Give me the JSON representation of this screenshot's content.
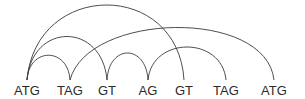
{
  "diagram": {
    "type": "arc-diagram",
    "nodes": [
      {
        "id": "n0",
        "label": "ATG",
        "x": 27
      },
      {
        "id": "n1",
        "label": "TAG",
        "x": 70
      },
      {
        "id": "n2",
        "label": "GT",
        "x": 107
      },
      {
        "id": "n3",
        "label": "AG",
        "x": 148
      },
      {
        "id": "n4",
        "label": "GT",
        "x": 184
      },
      {
        "id": "n5",
        "label": "TAG",
        "x": 226
      },
      {
        "id": "n6",
        "label": "ATG",
        "x": 274
      }
    ],
    "arcs": [
      {
        "from": "n0",
        "to": "n1",
        "peak_y": 56
      },
      {
        "from": "n0",
        "to": "n2",
        "peak_y": 40
      },
      {
        "from": "n0",
        "to": "n4",
        "peak_y": 7
      },
      {
        "from": "n1",
        "to": "n6",
        "peak_y": 29
      },
      {
        "from": "n2",
        "to": "n3",
        "peak_y": 54
      },
      {
        "from": "n3",
        "to": "n5",
        "peak_y": 52
      }
    ],
    "colors": {
      "line": "#3a3a3a",
      "text": "#2a2a2a",
      "background": "#ffffff"
    }
  }
}
